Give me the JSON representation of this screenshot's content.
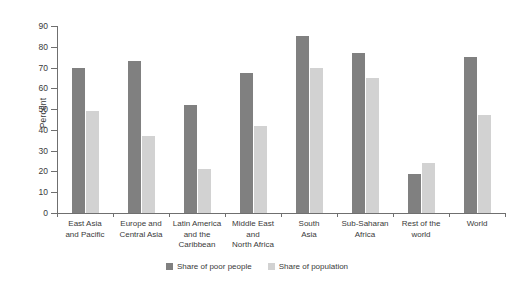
{
  "chart_data": {
    "type": "bar",
    "title": "",
    "xlabel": "",
    "ylabel": "Percent",
    "ylim": [
      0,
      90
    ],
    "ytick_values": [
      0,
      10,
      20,
      30,
      40,
      50,
      60,
      70,
      80,
      90
    ],
    "ytick_labels": [
      "0",
      "10",
      "20",
      "30",
      "40",
      "50",
      "60",
      "70",
      "80",
      "90"
    ],
    "grid": false,
    "legend_position": "bottom-center",
    "categories": [
      "East Asia and Pacific",
      "Europe and Central Asia",
      "Latin America and the Caribbean",
      "Middle East and North Africa",
      "South Asia",
      "Sub-Saharan Africa",
      "Rest of the world",
      "World"
    ],
    "category_lines": [
      [
        "East Asia",
        "and Pacific"
      ],
      [
        "Europe and",
        "Central Asia"
      ],
      [
        "Latin America",
        "and the",
        "Caribbean"
      ],
      [
        "Middle East",
        "and",
        "North Africa"
      ],
      [
        "South",
        "Asia"
      ],
      [
        "Sub-Saharan",
        "Africa"
      ],
      [
        "Rest of the",
        "world"
      ],
      [
        "World"
      ]
    ],
    "series": [
      {
        "name": "Share of poor people",
        "color": "#808080",
        "values": [
          70,
          73,
          52,
          67.5,
          85,
          77,
          19,
          75
        ]
      },
      {
        "name": "Share of population",
        "color": "#d2d2d2",
        "values": [
          49,
          37,
          21,
          42,
          70,
          65,
          24,
          47
        ]
      }
    ]
  },
  "legend": {
    "items": [
      {
        "label": "Share of poor people",
        "swatch": "dark"
      },
      {
        "label": "Share of population",
        "swatch": "light"
      }
    ]
  },
  "colors": {
    "series_dark": "#808080",
    "series_light": "#d2d2d2",
    "axis": "#6f6f6f",
    "text": "#3a3a3a",
    "background": "#ffffff"
  }
}
